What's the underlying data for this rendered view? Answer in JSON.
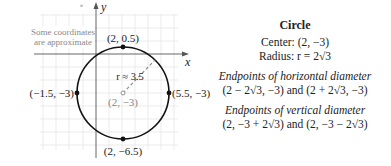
{
  "figure": {
    "note_line1": "Some coordinates",
    "note_line2": "are approximate",
    "axis_x": "x",
    "axis_y": "y",
    "points": {
      "top": "(2, 0.5)",
      "bottom": "(2, −6.5)",
      "left": "(−1.5, −3)",
      "right": "(5.5, −3)",
      "center": "(2, −3)"
    },
    "radius_label": "r ≈ 3.5"
  },
  "panel": {
    "title": "Circle",
    "center": "Center: (2, −3)",
    "radius": "Radius: r = 2√3",
    "horizontal_heading": "Endpoints of horizontal diameter",
    "horizontal_values": "(2 − 2√3, −3) and (2 + 2√3, −3)",
    "vertical_heading": "Endpoints of vertical diameter",
    "vertical_values": "(2, −3 + 2√3) and (2, −3 − 2√3)"
  }
}
